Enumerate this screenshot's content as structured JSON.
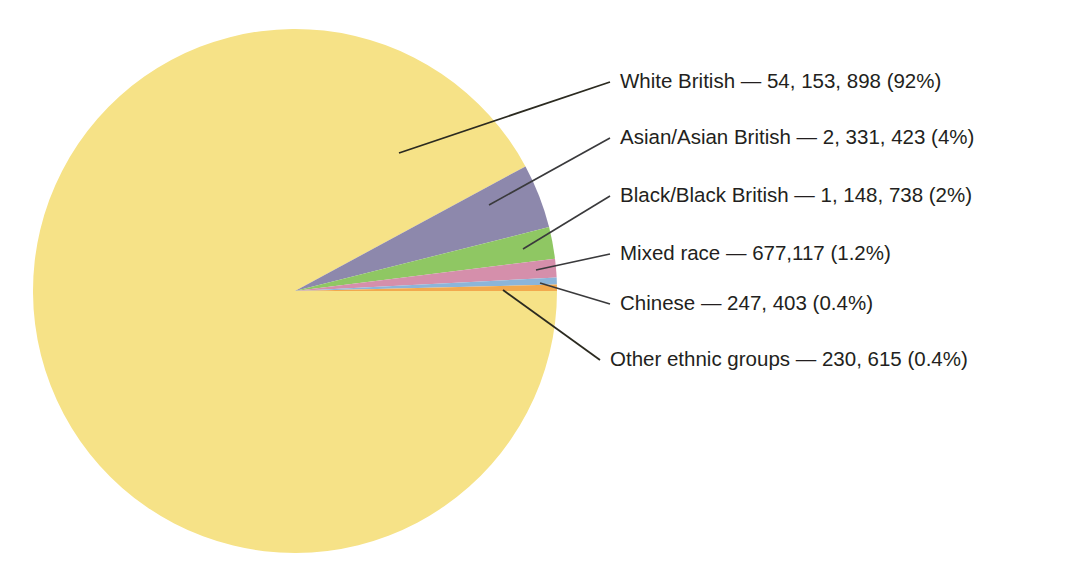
{
  "chart_data": {
    "type": "pie",
    "title": "",
    "subtitle": "",
    "xlabel": "",
    "ylabel": "",
    "legend_position": "callout-labels-right",
    "grid": false,
    "total_label": "",
    "categories": [
      "White British",
      "Asian/Asian British",
      "Black/Black British",
      "Mixed race",
      "Chinese",
      "Other ethnic groups"
    ],
    "values": [
      54153898,
      2331423,
      1148738,
      677117,
      247403,
      230615
    ],
    "percentages": [
      92,
      4,
      2,
      1.2,
      0.4,
      0.4
    ],
    "colors": [
      "#f6e287",
      "#8d88ac",
      "#8fc763",
      "#d58fab",
      "#8cb5d9",
      "#f2a94e"
    ],
    "slices": [
      {
        "name": "White British",
        "value": 54153898,
        "value_text": "54, 153, 898",
        "percent": 92,
        "percent_text": "(92%)",
        "label": "White British — 54, 153, 898 (92%)",
        "color": "#f6e287"
      },
      {
        "name": "Asian/Asian British",
        "value": 2331423,
        "value_text": "2, 331, 423",
        "percent": 4,
        "percent_text": "(4%)",
        "label": "Asian/Asian British — 2, 331, 423 (4%)",
        "color": "#8d88ac"
      },
      {
        "name": "Black/Black British",
        "value": 1148738,
        "value_text": "1, 148, 738",
        "percent": 2,
        "percent_text": "(2%)",
        "label": "Black/Black British — 1, 148, 738 (2%)",
        "color": "#8fc763"
      },
      {
        "name": "Mixed race",
        "value": 677117,
        "value_text": "677,117",
        "percent": 1.2,
        "percent_text": "(1.2%)",
        "label": "Mixed race — 677,117 (1.2%)",
        "color": "#d58fab"
      },
      {
        "name": "Chinese",
        "value": 247403,
        "value_text": "247, 403",
        "percent": 0.4,
        "percent_text": "(0.4%)",
        "label": "Chinese — 247, 403 (0.4%)",
        "color": "#8cb5d9"
      },
      {
        "name": "Other ethnic groups",
        "value": 230615,
        "value_text": "230, 615",
        "percent": 0.4,
        "percent_text": "(0.4%)",
        "label": "Other ethnic groups — 230, 615 (0.4%)",
        "color": "#f2a94e"
      }
    ]
  },
  "colors": {
    "background": "#ffffff",
    "text": "#231f20",
    "leader_line": "#3a3a3c",
    "leader_line_dark": "#2b2a20"
  }
}
